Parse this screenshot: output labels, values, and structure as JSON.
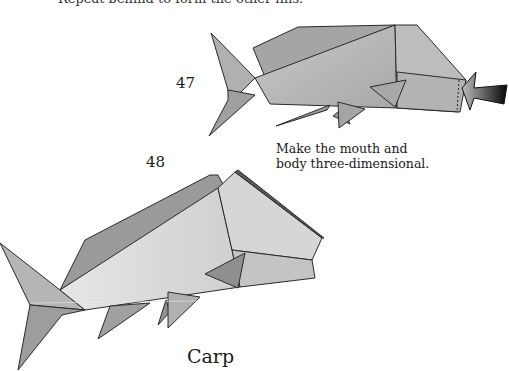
{
  "page": {
    "top_caption": "Repeat behind to form the other fins.",
    "steps": [
      {
        "number": "47"
      },
      {
        "number": "48"
      }
    ],
    "instruction": {
      "line1": "Make the mouth and",
      "line2": "body three-dimensional."
    },
    "model_title": "Carp"
  },
  "colors": {
    "paper_light": "#d9d9d9",
    "paper_mid": "#b5b5b5",
    "paper_dark": "#8c8c8c",
    "outline": "#2a2a2a",
    "arrow": "#111111"
  }
}
